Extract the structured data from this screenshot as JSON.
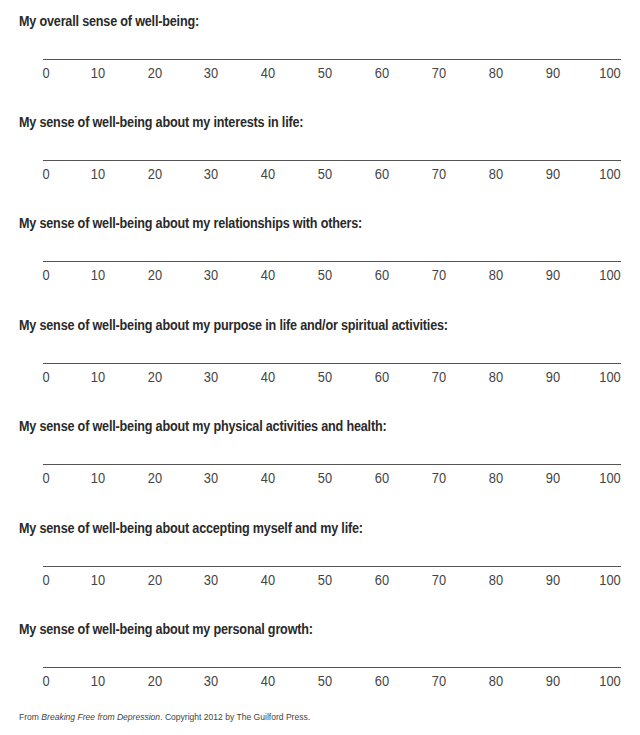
{
  "scale": {
    "ticks": [
      "0",
      "10",
      "20",
      "30",
      "40",
      "50",
      "60",
      "70",
      "80",
      "90",
      "100"
    ]
  },
  "items": [
    {
      "label": "My overall sense of well-being:"
    },
    {
      "label": "My sense of well-being about my interests in life:"
    },
    {
      "label": "My sense of well-being about my relationships with others:"
    },
    {
      "label": "My sense of well-being about my purpose in life and/or spiritual activities:"
    },
    {
      "label": "My sense of well-being about my physical activities and health:"
    },
    {
      "label": "My sense of well-being about accepting myself and my life:"
    },
    {
      "label": "My sense of well-being about my personal growth:"
    }
  ],
  "footer": {
    "prefix": "From ",
    "title": "Breaking Free from Depression",
    "suffix": ". Copyright 2012 by The Guilford Press."
  }
}
